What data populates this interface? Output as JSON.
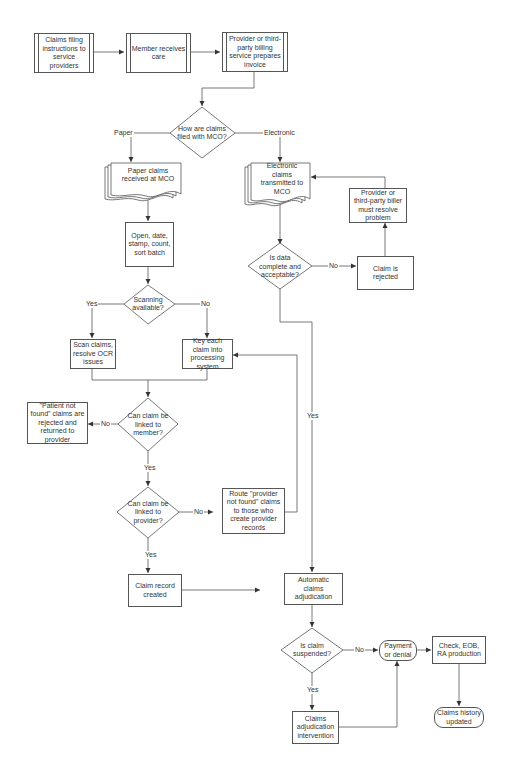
{
  "diagram": {
    "type": "flowchart",
    "nodes": {
      "claims_filing": "Claims filing instructions to service providers",
      "member_care": "Member receives care",
      "provider_invoice": "Provider or third-party billing service prepares invoice",
      "how_filed": "How are claims filed with MCO?",
      "paper_received": "Paper claims received at MCO",
      "electronic_transmitted": "Electronic claims transmitted to MCO",
      "provider_resolve": "Provider or third-party biller must resolve problem",
      "open_batch": "Open, date, stamp, count, sort batch",
      "data_complete": "Is data complete and acceptable?",
      "claim_rejected": "Claim is rejected",
      "scanning_available": "Scanning available?",
      "scan_claims": "Scan claims, resolve OCR issues",
      "key_claim": "Key each claim into processing system",
      "patient_not_found": "\"Patient not found\" claims are rejected and returned to provider",
      "linked_member": "Can claim be linked to member?",
      "linked_provider": "Can claim be linked to provider?",
      "route_provider": "Route \"provider not found\" claims to those who create provider records",
      "claim_record": "Claim record created",
      "auto_adjudication": "Automatic claims adjudication",
      "claim_suspended": "Is claim suspended?",
      "payment_denial": "Payment or denial",
      "check_eob": "Check, EOB, RA production",
      "adjudication_intervention": "Claims adjudication intervention",
      "history_updated": "Claims history updated"
    },
    "labels": {
      "paper": "Paper",
      "electronic": "Electronic",
      "no": "No",
      "yes": "Yes"
    },
    "edges": [
      {
        "from": "claims_filing",
        "to": "member_care"
      },
      {
        "from": "member_care",
        "to": "provider_invoice"
      },
      {
        "from": "provider_invoice",
        "to": "how_filed"
      },
      {
        "from": "how_filed",
        "to": "paper_received",
        "label": "Paper"
      },
      {
        "from": "how_filed",
        "to": "electronic_transmitted",
        "label": "Electronic"
      },
      {
        "from": "paper_received",
        "to": "open_batch"
      },
      {
        "from": "open_batch",
        "to": "scanning_available"
      },
      {
        "from": "scanning_available",
        "to": "scan_claims",
        "label": "Yes"
      },
      {
        "from": "scanning_available",
        "to": "key_claim",
        "label": "No"
      },
      {
        "from": "scan_claims",
        "to": "linked_member"
      },
      {
        "from": "key_claim",
        "to": "linked_member"
      },
      {
        "from": "linked_member",
        "to": "patient_not_found",
        "label": "No"
      },
      {
        "from": "linked_member",
        "to": "linked_provider",
        "label": "Yes"
      },
      {
        "from": "linked_provider",
        "to": "route_provider",
        "label": "No"
      },
      {
        "from": "route_provider",
        "to": "key_claim"
      },
      {
        "from": "linked_provider",
        "to": "claim_record",
        "label": "Yes"
      },
      {
        "from": "claim_record",
        "to": "auto_adjudication"
      },
      {
        "from": "electronic_transmitted",
        "to": "data_complete"
      },
      {
        "from": "data_complete",
        "to": "claim_rejected",
        "label": "No"
      },
      {
        "from": "claim_rejected",
        "to": "provider_resolve"
      },
      {
        "from": "provider_resolve",
        "to": "electronic_transmitted"
      },
      {
        "from": "data_complete",
        "to": "auto_adjudication",
        "label": "Yes"
      },
      {
        "from": "auto_adjudication",
        "to": "claim_suspended"
      },
      {
        "from": "claim_suspended",
        "to": "payment_denial",
        "label": "No"
      },
      {
        "from": "claim_suspended",
        "to": "adjudication_intervention",
        "label": "Yes"
      },
      {
        "from": "adjudication_intervention",
        "to": "payment_denial"
      },
      {
        "from": "payment_denial",
        "to": "check_eob"
      },
      {
        "from": "check_eob",
        "to": "history_updated"
      }
    ],
    "colors": {
      "stroke": "#555555",
      "text": "#333333",
      "background": "#ffffff"
    }
  }
}
